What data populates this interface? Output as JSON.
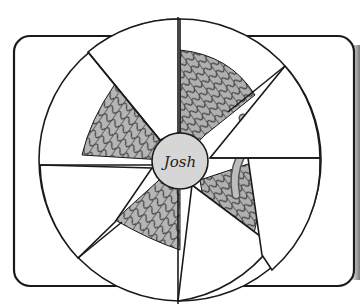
{
  "illustration": {
    "center_label": "Josh",
    "colors": {
      "background": "#ffffff",
      "outline": "#1a1a1a",
      "rope_fill": "#b5b5b5",
      "rope_shadow": "#6a6a6a",
      "label_circle_fill": "#d6d6d6",
      "right_edge_shade": "#7a7a7a"
    },
    "wheel": {
      "cx": 180,
      "cy": 160,
      "r": 141
    },
    "label_circle": {
      "cx": 180,
      "cy": 161,
      "r": 28
    },
    "frame": {
      "x": 14,
      "y": 36,
      "width": 340,
      "height": 250,
      "radius": 16
    }
  }
}
